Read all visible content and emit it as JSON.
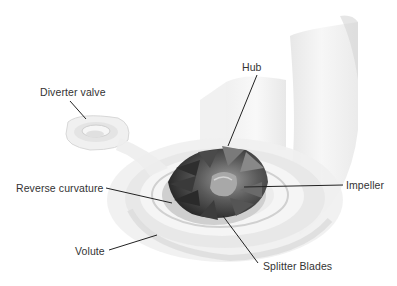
{
  "diagram": {
    "type": "labeled-illustration",
    "labels": [
      {
        "id": "diverter-valve",
        "text": "Diverter valve",
        "x": 40,
        "y": 86
      },
      {
        "id": "hub",
        "text": "Hub",
        "x": 242,
        "y": 61
      },
      {
        "id": "reverse-curvature",
        "text": "Reverse curvature",
        "x": 16,
        "y": 182
      },
      {
        "id": "volute",
        "text": "Volute",
        "x": 75,
        "y": 245
      },
      {
        "id": "impeller",
        "text": "Impeller",
        "x": 346,
        "y": 179
      },
      {
        "id": "splitter-blades",
        "text": "Splitter Blades",
        "x": 263,
        "y": 260
      }
    ],
    "colors": {
      "text": "#333333",
      "leader": "#222222",
      "housing": "#e6e6e6",
      "impeller_dark": "#3a3a3a",
      "impeller_mid": "#8a8a8a",
      "background": "#ffffff"
    }
  }
}
